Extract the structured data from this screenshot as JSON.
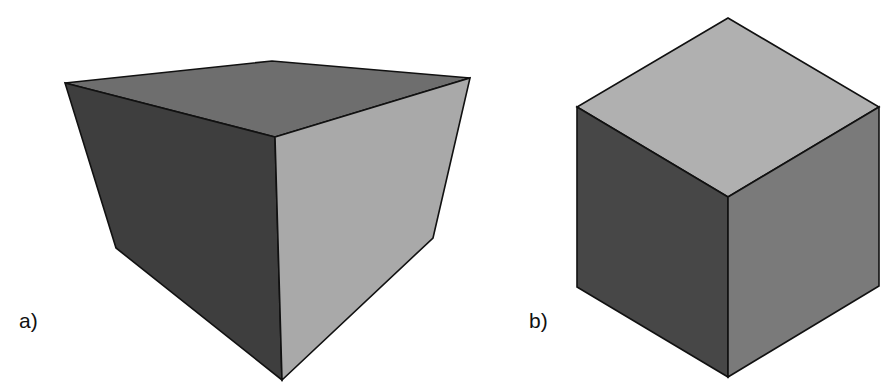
{
  "figure": {
    "panels": [
      {
        "label": "a)",
        "description": "cube drawn in perspective (viewed from below-front corner)",
        "faces": {
          "top": {
            "color": "#6e6e6e",
            "points": "65,83 272,61 470,78 275,137"
          },
          "left": {
            "color": "#3e3e3e",
            "points": "65,83 275,137 282,380 116,248"
          },
          "right": {
            "color": "#a9a9a9",
            "points": "275,137 470,78 433,238 282,380"
          }
        }
      },
      {
        "label": "b)",
        "description": "cube drawn in isometric projection",
        "faces": {
          "top": {
            "color": "#b0b0b0",
            "points": "728,18 879,107 728,197 577,107"
          },
          "left": {
            "color": "#474747",
            "points": "577,107 728,197 728,377 577,287"
          },
          "right": {
            "color": "#7a7a7a",
            "points": "728,197 879,107 879,286 728,377"
          }
        }
      }
    ]
  }
}
